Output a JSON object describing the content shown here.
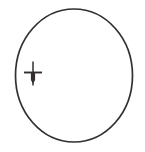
{
  "figure": {
    "title": "circle-with-cross-marker",
    "canvas": {
      "width": 145,
      "height": 152,
      "background_color": "#ffffff"
    },
    "stroke_color": "#332f2e",
    "shapes": {
      "circle": {
        "name": "circle-outline",
        "center_x": 74,
        "center_y": 75.5,
        "radius_x": 58.5,
        "radius_y": 66.5,
        "stroke_width": 1.7,
        "fill": "none"
      },
      "marker": {
        "name": "cross-arrow-marker",
        "center_x": 33,
        "center_y": 72.5,
        "horizontal_bar": {
          "x1": 24,
          "x2": 42,
          "y": 72.5,
          "stroke_width": 1.9
        },
        "vertical_stem": {
          "x": 33,
          "y_top": 61.5,
          "y_bottom": 85.5,
          "stroke_width": 1.5
        },
        "arrow_body": {
          "x": 33,
          "y_top": 73,
          "y_bottom": 80,
          "width": 4.2
        }
      }
    }
  }
}
